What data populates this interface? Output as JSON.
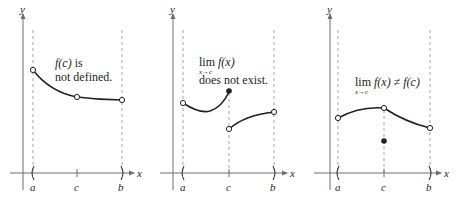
{
  "colors": {
    "ink": "#231f20",
    "axis": "#6d6e71",
    "dashed": "#8a8c8e",
    "background": "#ffffff"
  },
  "panels": [
    {
      "id": "panel-1",
      "y_axis_label": "y",
      "x_axis_label": "x",
      "tick_labels": [
        "a",
        "c",
        "b"
      ],
      "annotation": {
        "line1_func": "f(c)",
        "line1_rest": " is",
        "line2": "not defined."
      },
      "description": "Curve with open circles at a, c, and b; f(c) undefined"
    },
    {
      "id": "panel-2",
      "y_axis_label": "y",
      "x_axis_label": "x",
      "tick_labels": [
        "a",
        "c",
        "b"
      ],
      "annotation": {
        "lim": "lim",
        "func": "f(x)",
        "subscript": "x→c",
        "line2": "does not exist."
      },
      "description": "Jump discontinuity at c: left piece ends at filled dot, right piece begins at open dot"
    },
    {
      "id": "panel-3",
      "y_axis_label": "y",
      "x_axis_label": "x",
      "tick_labels": [
        "a",
        "c",
        "b"
      ],
      "annotation": {
        "lim": "lim",
        "func": "f(x)",
        "neq": " ≠ ",
        "func2": "f(c)",
        "subscript": "x→c"
      },
      "description": "Removable discontinuity: open circle on curve at c, filled point below at f(c)"
    }
  ]
}
